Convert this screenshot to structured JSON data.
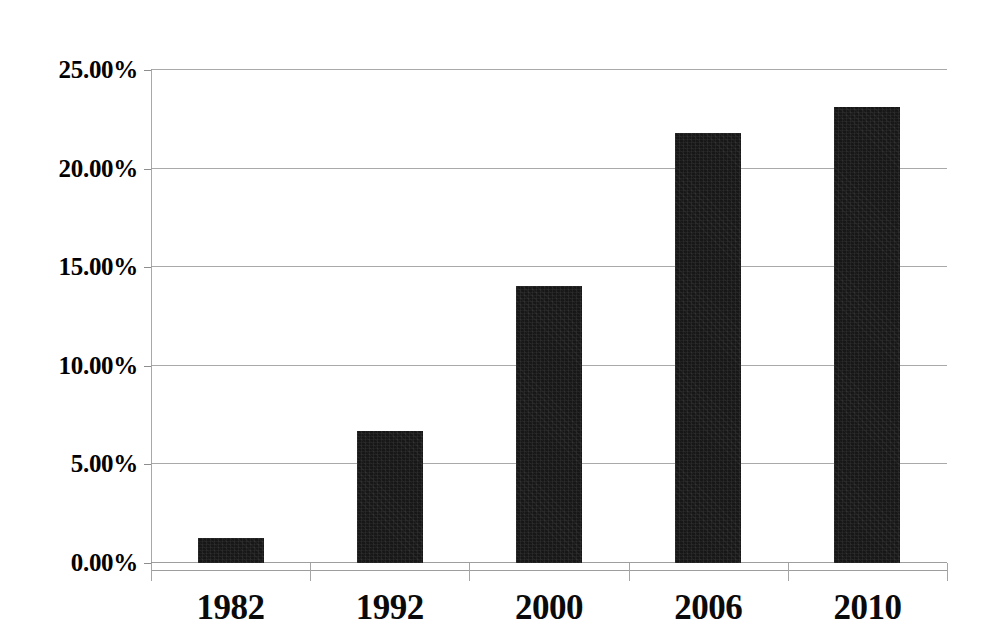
{
  "chart_data": {
    "type": "bar",
    "title": "",
    "subtitle": "",
    "xlabel": "",
    "ylabel": "",
    "categories": [
      "1982",
      "1992",
      "2000",
      "2006",
      "2010"
    ],
    "values": [
      1.25,
      6.7,
      14.06,
      21.8,
      23.1
    ],
    "value_labels": [
      "1.25%",
      "6.70%",
      "14.06%",
      "21.80%",
      "23.10%"
    ],
    "ylim": [
      0,
      25
    ],
    "ytick_values": [
      0,
      5,
      10,
      15,
      20,
      25
    ],
    "ytick_labels": [
      "0.00%",
      "5.00%",
      "10.00%",
      "15.00%",
      "20.00%",
      "25.00%"
    ],
    "grid": true,
    "grid_axis": "y",
    "legend": false,
    "legend_position": "none",
    "series": [
      {
        "name": "",
        "values": [
          1.25,
          6.7,
          14.06,
          21.8,
          23.1
        ],
        "color": "#171717"
      }
    ],
    "colors": {
      "bar": "#171717",
      "gridline": "#9a9a9a",
      "axis": "#a8a8a8",
      "text": "#000000",
      "background": "#ffffff"
    }
  }
}
